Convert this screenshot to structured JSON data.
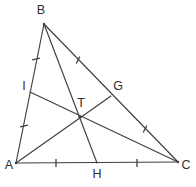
{
  "figure": {
    "background_color": "#ffffff",
    "stroke_color": "#3f3f3f",
    "label_color": "#2e2e2e",
    "width": 196,
    "height": 187
  },
  "points": {
    "A": {
      "label": "A",
      "x": 16,
      "y": 163,
      "label_x": 9,
      "label_y": 166,
      "role": "vertex"
    },
    "B": {
      "label": "B",
      "x": 44,
      "y": 24,
      "label_x": 41,
      "label_y": 11,
      "role": "vertex"
    },
    "C": {
      "label": "C",
      "x": 178,
      "y": 162,
      "label_x": 186,
      "label_y": 166,
      "role": "vertex"
    },
    "G": {
      "label": "G",
      "x": 111,
      "y": 96,
      "label_x": 118,
      "label_y": 87,
      "role": "midpoint-of-BC"
    },
    "H": {
      "label": "H",
      "x": 97,
      "y": 163,
      "label_x": 97,
      "label_y": 175,
      "role": "midpoint-of-AC"
    },
    "I": {
      "label": "I",
      "x": 30,
      "y": 92,
      "label_x": 24,
      "label_y": 87,
      "role": "midpoint-of-AB"
    },
    "T": {
      "label": "T",
      "x": 80,
      "y": 117,
      "label_x": 81,
      "label_y": 104,
      "role": "centroid"
    }
  },
  "edges": [
    {
      "name": "side-AB",
      "from": "A",
      "to": "B"
    },
    {
      "name": "side-BC",
      "from": "B",
      "to": "C"
    },
    {
      "name": "side-AC",
      "from": "A",
      "to": "C"
    }
  ],
  "medians": [
    {
      "name": "median-AG",
      "from": "A",
      "to": "G"
    },
    {
      "name": "median-BH",
      "from": "B",
      "to": "H"
    },
    {
      "name": "median-CI",
      "from": "C",
      "to": "I"
    }
  ],
  "tick_marks": [
    {
      "name": "tick-AI",
      "segment": "A-I",
      "x": 24,
      "y": 126,
      "angle": 78
    },
    {
      "name": "tick-IB",
      "segment": "I-B",
      "x": 36,
      "y": 59,
      "angle": 78
    },
    {
      "name": "tick-BG",
      "segment": "B-G",
      "x": 78,
      "y": 60,
      "angle": 27
    },
    {
      "name": "tick-GC",
      "segment": "G-C",
      "x": 145,
      "y": 129,
      "angle": 27
    },
    {
      "name": "tick-AH",
      "segment": "A-H",
      "x": 56,
      "y": 163,
      "angle": 0
    },
    {
      "name": "tick-HC",
      "segment": "H-C",
      "x": 137,
      "y": 163,
      "angle": 0
    }
  ]
}
